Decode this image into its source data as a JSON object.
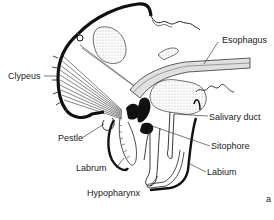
{
  "diagram": {
    "panel_letter": "a",
    "labels": [
      {
        "id": "clypeus",
        "text": "Clypeus"
      },
      {
        "id": "esophagus",
        "text": "Esophagus"
      },
      {
        "id": "salivary_duct",
        "text": "Salivary duct"
      },
      {
        "id": "pestle",
        "text": "Pestle"
      },
      {
        "id": "sitophore",
        "text": "Sitophore"
      },
      {
        "id": "labrum",
        "text": "Labrum"
      },
      {
        "id": "labium",
        "text": "Labium"
      },
      {
        "id": "hypopharynx",
        "text": "Hypopharynx"
      }
    ]
  }
}
